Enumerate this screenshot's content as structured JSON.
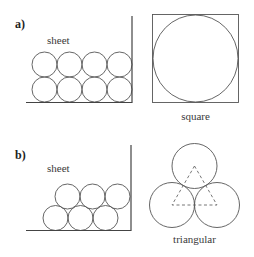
{
  "panels": {
    "a": {
      "label": "a)",
      "sheet_label": "sheet",
      "packing_label": "square",
      "circles": [
        {
          "cx": 44.5,
          "cy": 64.5
        },
        {
          "cx": 69.5,
          "cy": 64.5
        },
        {
          "cx": 94.5,
          "cy": 64.5
        },
        {
          "cx": 119.5,
          "cy": 64.5
        },
        {
          "cx": 44.5,
          "cy": 89.5
        },
        {
          "cx": 69.5,
          "cy": 89.5
        },
        {
          "cx": 94.5,
          "cy": 89.5
        },
        {
          "cx": 119.5,
          "cy": 89.5
        }
      ]
    },
    "b": {
      "label": "b)",
      "sheet_label": "sheet",
      "packing_label": "triangular",
      "circles": [
        {
          "cx": 55.5,
          "cy": 218
        },
        {
          "cx": 80.5,
          "cy": 218
        },
        {
          "cx": 105.5,
          "cy": 218
        },
        {
          "cx": 67.5,
          "cy": 196
        },
        {
          "cx": 92.5,
          "cy": 196
        },
        {
          "cx": 117.5,
          "cy": 196
        }
      ]
    }
  }
}
